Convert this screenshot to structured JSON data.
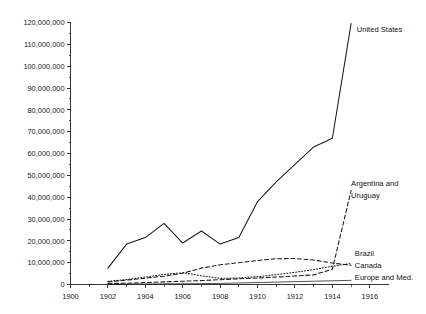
{
  "chart_data": {
    "type": "line",
    "title": "",
    "subtitle": "",
    "xlabel": "",
    "ylabel": "",
    "xlim": [
      1900,
      1917
    ],
    "ylim": [
      0,
      120000000
    ],
    "grid": false,
    "legend_position": "inline-right-labels",
    "x_tick_labels": [
      "1900",
      "1902",
      "1904",
      "1906",
      "1908",
      "1910",
      "1912",
      "1914",
      "1916"
    ],
    "x_ticks": [
      1900,
      1902,
      1904,
      1906,
      1908,
      1910,
      1912,
      1914,
      1916
    ],
    "x_minor_ticks": [
      1901,
      1903,
      1905,
      1907,
      1909,
      1911,
      1913,
      1915
    ],
    "y_tick_labels": [
      "0",
      "10,000,000",
      "20,000,000",
      "30,000,000",
      "40,000,000",
      "50,000,000",
      "60,000,000",
      "70,000,000",
      "80,000,000",
      "90,000,000",
      "100,000,000",
      "110,000,000",
      "120,000,000"
    ],
    "y_ticks": [
      0,
      10000000,
      20000000,
      30000000,
      40000000,
      50000000,
      60000000,
      70000000,
      80000000,
      90000000,
      100000000,
      110000000,
      120000000
    ],
    "y_minor_ticks": [
      5000000,
      15000000,
      25000000,
      35000000,
      45000000,
      55000000,
      65000000,
      75000000,
      85000000,
      95000000,
      105000000,
      115000000
    ],
    "series": [
      {
        "name": "United States",
        "label": "United States",
        "style": "solid",
        "color": "#1b1b1b",
        "x": [
          1902,
          1903,
          1904,
          1905,
          1906,
          1907,
          1908,
          1909,
          1910,
          1911,
          1912,
          1913,
          1914,
          1915
        ],
        "values": [
          7500000,
          18500000,
          21500000,
          28000000,
          19000000,
          24500000,
          18500000,
          21500000,
          38000000,
          47000000,
          55000000,
          63000000,
          67000000,
          119500000
        ]
      },
      {
        "name": "Argentina and Uruguay",
        "label": "Argentina and Uruguay",
        "style": "dashed",
        "color": "#1b1b1b",
        "x": [
          1902,
          1903,
          1904,
          1905,
          1906,
          1907,
          1908,
          1909,
          1910,
          1911,
          1912,
          1913,
          1914,
          1915
        ],
        "values": [
          400000,
          600000,
          900000,
          1200000,
          1500000,
          1800000,
          2200000,
          2600000,
          3000000,
          3400000,
          3900000,
          4400000,
          7000000,
          43000000
        ]
      },
      {
        "name": "Canada",
        "label": "Canada",
        "style": "dashed",
        "color": "#1b1b1b",
        "x": [
          1902,
          1903,
          1904,
          1905,
          1906,
          1907,
          1908,
          1909,
          1910,
          1911,
          1912,
          1913,
          1914,
          1915
        ],
        "values": [
          1200000,
          2000000,
          2900000,
          3800000,
          5200000,
          7500000,
          9000000,
          10000000,
          11000000,
          11800000,
          11900000,
          11200000,
          9800000,
          8800000
        ]
      },
      {
        "name": "Brazil",
        "label": "Brazil",
        "style": "dotted",
        "color": "#1b1b1b",
        "x": [
          1902,
          1903,
          1904,
          1905,
          1906,
          1907,
          1908,
          1909,
          1910,
          1911,
          1912,
          1913,
          1914,
          1915
        ],
        "values": [
          1400000,
          2300000,
          3400000,
          4600000,
          5400000,
          4000000,
          2800000,
          3000000,
          3600000,
          4500000,
          5600000,
          6800000,
          8400000,
          9600000
        ]
      },
      {
        "name": "Europe and Med.",
        "label": "Europe and Med.",
        "style": "thin-solid",
        "color": "#1b1b1b",
        "x": [
          1902,
          1903,
          1904,
          1905,
          1906,
          1907,
          1908,
          1909,
          1910,
          1911,
          1912,
          1913,
          1914,
          1915
        ],
        "values": [
          150000,
          200000,
          250000,
          300000,
          350000,
          400000,
          500000,
          700000,
          900000,
          1100000,
          1300000,
          1500000,
          1700000,
          1900000
        ]
      }
    ],
    "annotations": [
      {
        "text": "United States",
        "x": 1915.3,
        "y": 117000000
      },
      {
        "text": "Argentina and",
        "x": 1915.0,
        "y": 46500000
      },
      {
        "text": "Uruguay",
        "x": 1915.0,
        "y": 41000000
      },
      {
        "text": "Brazil",
        "x": 1915.2,
        "y": 14500000
      },
      {
        "text": "Canada",
        "x": 1915.2,
        "y": 9000000
      },
      {
        "text": "Europe and Med.",
        "x": 1915.2,
        "y": 3500000
      }
    ]
  }
}
